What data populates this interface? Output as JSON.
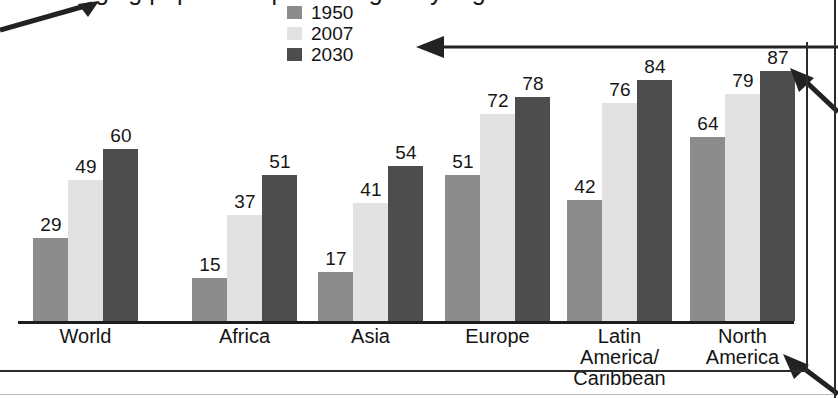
{
  "figure": {
    "title_partial": "ging population percentages by region",
    "baseline_present": true
  },
  "legend": {
    "position": "top-center",
    "entries": [
      {
        "label": "1950",
        "color": "#8c8c8c",
        "swatch": "legend-swatch-1950"
      },
      {
        "label": "2007",
        "color": "#e2e2e2",
        "swatch": "legend-swatch-2007"
      },
      {
        "label": "2030",
        "color": "#4d4d4d",
        "swatch": "legend-swatch-2030"
      }
    ]
  },
  "annotations": [
    {
      "name": "arrow-to-title",
      "direction": "up-right",
      "target": "chart title"
    },
    {
      "name": "arrow-to-legend",
      "direction": "left",
      "target": "legend"
    },
    {
      "name": "arrow-to-bar",
      "direction": "up-left",
      "target": "2030 bar, North America"
    },
    {
      "name": "arrow-to-category",
      "direction": "up-left",
      "target": "category axis label"
    }
  ],
  "chart_data": {
    "type": "bar",
    "title": "ging population percentages by region",
    "xlabel": "",
    "ylabel": "",
    "ylim": [
      0,
      100
    ],
    "grid": false,
    "legend_position": "top-center",
    "categories": [
      "World",
      "Africa",
      "Asia",
      "Europe",
      "Latin America/Caribbean",
      "North America"
    ],
    "category_lines": [
      [
        "World"
      ],
      [
        "Africa"
      ],
      [
        "Asia"
      ],
      [
        "Europe"
      ],
      [
        "Latin",
        "America/",
        "Caribbean"
      ],
      [
        "North",
        "America"
      ]
    ],
    "series": [
      {
        "name": "1950",
        "color": "#8c8c8c",
        "values": [
          29,
          15,
          17,
          51,
          42,
          64
        ]
      },
      {
        "name": "2007",
        "color": "#e2e2e2",
        "values": [
          49,
          37,
          41,
          72,
          76,
          79
        ]
      },
      {
        "name": "2030",
        "color": "#4d4d4d",
        "values": [
          60,
          51,
          54,
          78,
          84,
          87
        ]
      }
    ]
  }
}
